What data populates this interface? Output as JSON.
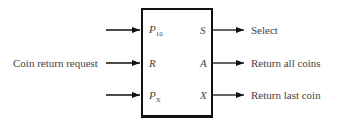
{
  "diagram": {
    "type": "block-diagram",
    "block": {
      "inputs": [
        {
          "pin": "P",
          "sub": "10",
          "external_label": ""
        },
        {
          "pin": "R",
          "sub": "",
          "external_label": "Coin return request"
        },
        {
          "pin": "P",
          "sub": "X",
          "external_label": ""
        }
      ],
      "outputs": [
        {
          "pin": "S",
          "external_label": "Select"
        },
        {
          "pin": "A",
          "external_label": "Return all coins"
        },
        {
          "pin": "X",
          "external_label": "Return last coin"
        }
      ]
    }
  }
}
